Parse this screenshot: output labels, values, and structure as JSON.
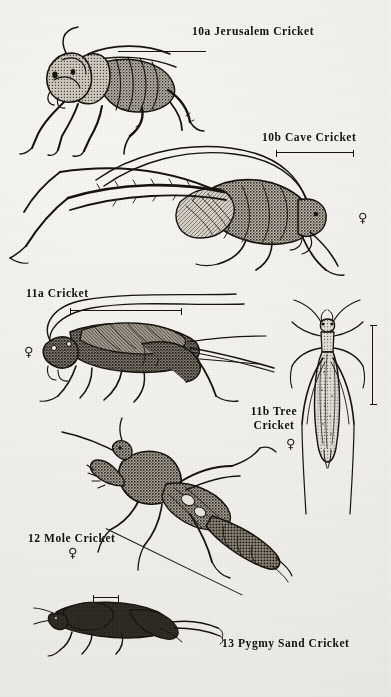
{
  "plate": {
    "background_color": "#f2f1ee",
    "ink_color": "#17140f",
    "medium": "engraved stipple illustration on aged paper"
  },
  "figures": [
    {
      "id": "10a",
      "number": "10a",
      "common_name": "Jerusalem Cricket",
      "label": "10a Jerusalem Cricket",
      "sex_symbol": "",
      "view": "lateral",
      "orientation": "facing left",
      "scale_bar": "horizontal",
      "notes": "large round head, stout body, long antennae arcing upward"
    },
    {
      "id": "10b",
      "number": "10b",
      "common_name": "Cave Cricket",
      "label": "10b Cave Cricket",
      "sex_symbol": "♀",
      "view": "lateral",
      "orientation": "facing right",
      "scale_bar": "horizontal",
      "notes": "humpbacked, extremely long hind legs and antennae"
    },
    {
      "id": "11a",
      "number": "11a",
      "common_name": "Cricket",
      "label": "11a Cricket",
      "sex_symbol": "♀",
      "view": "lateral",
      "orientation": "facing left",
      "scale_bar": "horizontal",
      "notes": "field cricket with long ovipositor and cerci trailing right"
    },
    {
      "id": "11b",
      "number": "11b",
      "common_name": "Tree Cricket",
      "label_line1": "11b Tree",
      "label_line2": "Cricket",
      "label": "11b Tree Cricket",
      "sex_symbol": "♀",
      "view": "dorsal",
      "orientation": "head up",
      "scale_bar": "vertical",
      "notes": "slender pale body seen from above, legs splayed"
    },
    {
      "id": "12",
      "number": "12",
      "common_name": "Mole Cricket",
      "label": "12 Mole Cricket",
      "sex_symbol": "♀",
      "view": "dorsolateral",
      "orientation": "diagonal, head upper-left",
      "scale_bar": "leader line",
      "notes": "broad shovel-like forelegs for digging, cylindrical abdomen"
    },
    {
      "id": "13",
      "number": "13",
      "common_name": "Pygmy Sand Cricket",
      "label": "13 Pygmy Sand Cricket",
      "sex_symbol": "",
      "view": "lateral",
      "orientation": "facing left",
      "scale_bar": "horizontal",
      "notes": "very small dark body, enlarged hind femur extended right"
    }
  ]
}
